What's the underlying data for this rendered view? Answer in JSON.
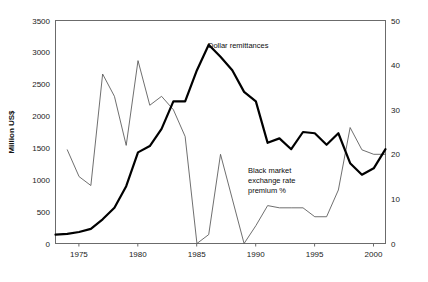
{
  "chart_data": {
    "type": "line",
    "title": "",
    "xlabel": "",
    "ylabel": "Million US$",
    "ylabel_right": "",
    "xlim": [
      1973,
      2001
    ],
    "ylim": [
      0,
      3500
    ],
    "ylim_right": [
      0,
      50
    ],
    "grid": false,
    "legend_position": "inline-annotations",
    "x_ticks": [
      "1975",
      "1980",
      "1985",
      "1990",
      "1995",
      "2000"
    ],
    "x_tick_values": [
      1975,
      1980,
      1985,
      1990,
      1995,
      2000
    ],
    "y_ticks_left": [
      "0",
      "500",
      "1000",
      "1500",
      "2000",
      "2500",
      "3000",
      "3500"
    ],
    "y_tick_values_left": [
      0,
      500,
      1000,
      1500,
      2000,
      2500,
      3000,
      3500
    ],
    "y_ticks_right": [
      "0",
      "10",
      "20",
      "30",
      "40",
      "50"
    ],
    "y_tick_values_right": [
      0,
      10,
      20,
      30,
      40,
      50
    ],
    "x": [
      1973,
      1974,
      1975,
      1976,
      1977,
      1978,
      1979,
      1980,
      1981,
      1982,
      1983,
      1984,
      1985,
      1986,
      1987,
      1988,
      1989,
      1990,
      1991,
      1992,
      1993,
      1994,
      1995,
      1996,
      1997,
      1998,
      1999,
      2000,
      2001
    ],
    "series": [
      {
        "name": "Dollar remittances",
        "axis": "left",
        "units": "Million US$",
        "style": "thick-black",
        "values": [
          140,
          150,
          180,
          230,
          380,
          560,
          900,
          1430,
          1530,
          1800,
          2230,
          2230,
          2720,
          3120,
          2930,
          2720,
          2380,
          2230,
          1580,
          1650,
          1480,
          1750,
          1730,
          1550,
          1730,
          1260,
          1080,
          1180,
          1480
        ]
      },
      {
        "name": "Black market exchange rate premium %",
        "axis": "right",
        "units": "%",
        "style": "thin-black",
        "values": [
          null,
          21,
          15,
          13,
          38,
          33,
          22,
          41,
          31,
          33,
          30,
          24,
          0,
          2,
          20,
          10,
          0,
          4,
          8.5,
          8,
          8,
          8,
          6,
          6,
          12,
          26,
          21,
          20,
          20
        ]
      }
    ],
    "annotations": [
      {
        "name": "dollar-remittances-label",
        "text": "Dollar remittances",
        "x": 1988,
        "y_left": 2950
      },
      {
        "name": "black-market-premium-label",
        "text_lines": [
          "Black market",
          "exchange rate",
          "premium %"
        ],
        "x": 1991,
        "y_right": 17
      }
    ]
  },
  "axes": {
    "left_title": "Million US$"
  },
  "annotations": {
    "dollar_remittances": "Dollar remittances",
    "black_market_line1": "Black market",
    "black_market_line2": "exchange rate",
    "black_market_line3": "premium %"
  },
  "ticks": {
    "left": [
      "3500",
      "3000",
      "2500",
      "2000",
      "1500",
      "1000",
      "500",
      "0"
    ],
    "right": [
      "50",
      "40",
      "30",
      "20",
      "10",
      "0"
    ],
    "bottom": [
      "1975",
      "1980",
      "1985",
      "1990",
      "1995",
      "2000"
    ]
  }
}
